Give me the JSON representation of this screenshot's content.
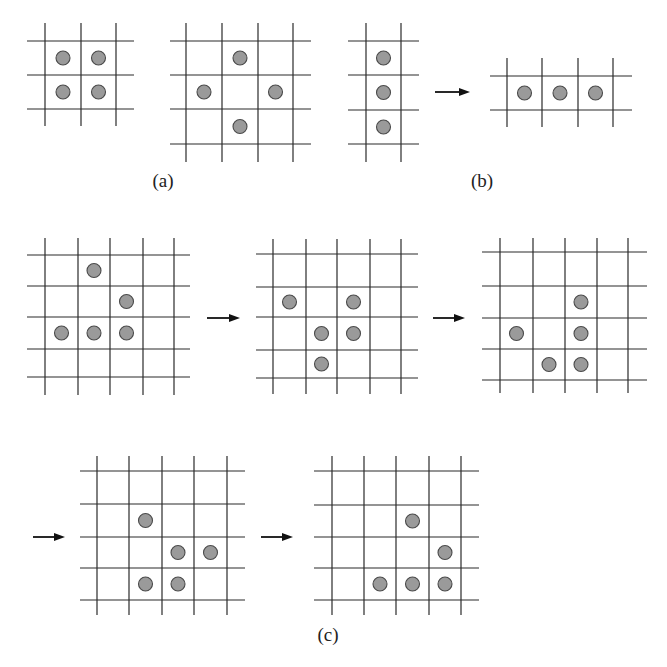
{
  "figure": {
    "labels": [
      {
        "id": "a",
        "text": "(a)",
        "x": 163,
        "y": 170
      },
      {
        "id": "b",
        "text": "(b)",
        "x": 482,
        "y": 170
      },
      {
        "id": "c",
        "text": "(c)",
        "x": 328,
        "y": 624
      }
    ],
    "colors": {
      "grid": "#2a2a2a",
      "cell_fill": "#9a9a9a",
      "cell_stroke": "#4a4a4a",
      "arrow": "#111111"
    },
    "panels": [
      {
        "name": "block-still-life",
        "group": "a",
        "vlines": [
          45,
          81,
          116
        ],
        "hlines": [
          41,
          75,
          109
        ],
        "xext": [
          27,
          134
        ],
        "yext": [
          23,
          126
        ],
        "cells": [
          [
            0,
            0
          ],
          [
            0,
            1
          ],
          [
            1,
            0
          ],
          [
            1,
            1
          ]
        ]
      },
      {
        "name": "tub-still-life",
        "group": "a",
        "vlines": [
          186,
          222,
          258,
          293
        ],
        "hlines": [
          41,
          75,
          109,
          144
        ],
        "xext": [
          170,
          311
        ],
        "yext": [
          23,
          162
        ],
        "cells": [
          [
            0,
            1
          ],
          [
            1,
            0
          ],
          [
            1,
            2
          ],
          [
            2,
            1
          ]
        ]
      },
      {
        "name": "blinker-vertical",
        "group": "b",
        "vlines": [
          366,
          401
        ],
        "hlines": [
          41,
          75,
          110,
          144
        ],
        "xext": [
          348,
          419
        ],
        "yext": [
          23,
          162
        ],
        "cells": [
          [
            0,
            0
          ],
          [
            1,
            0
          ],
          [
            2,
            0
          ]
        ]
      },
      {
        "name": "blinker-horizontal",
        "group": "b",
        "vlines": [
          507,
          542,
          578,
          613
        ],
        "hlines": [
          76,
          110
        ],
        "xext": [
          490,
          632
        ],
        "yext": [
          58,
          127
        ],
        "cells": [
          [
            0,
            0
          ],
          [
            0,
            1
          ],
          [
            0,
            2
          ]
        ]
      },
      {
        "name": "glider-gen-0",
        "group": "c",
        "vlines": [
          45,
          78,
          110,
          143,
          174
        ],
        "hlines": [
          255,
          286,
          317,
          349,
          377
        ],
        "xext": [
          27,
          190
        ],
        "yext": [
          238,
          395
        ],
        "cells": [
          [
            0,
            1
          ],
          [
            1,
            2
          ],
          [
            2,
            0
          ],
          [
            2,
            1
          ],
          [
            2,
            2
          ]
        ]
      },
      {
        "name": "glider-gen-1",
        "group": "c",
        "vlines": [
          273,
          306,
          337,
          370,
          401
        ],
        "hlines": [
          254,
          287,
          317,
          350,
          378
        ],
        "xext": [
          256,
          418
        ],
        "yext": [
          239,
          394
        ],
        "cells": [
          [
            1,
            0
          ],
          [
            1,
            2
          ],
          [
            2,
            1
          ],
          [
            2,
            2
          ],
          [
            3,
            1
          ]
        ]
      },
      {
        "name": "glider-gen-2",
        "group": "c",
        "vlines": [
          500,
          533,
          565,
          597,
          628
        ],
        "hlines": [
          252,
          286,
          318,
          349,
          380
        ],
        "xext": [
          482,
          647
        ],
        "yext": [
          238,
          393
        ],
        "cells": [
          [
            1,
            2
          ],
          [
            2,
            0
          ],
          [
            2,
            2
          ],
          [
            3,
            1
          ],
          [
            3,
            2
          ]
        ]
      },
      {
        "name": "glider-gen-3",
        "group": "c",
        "vlines": [
          97,
          129,
          162,
          194,
          227
        ],
        "hlines": [
          471,
          504,
          537,
          568,
          600
        ],
        "xext": [
          80,
          245
        ],
        "yext": [
          456,
          615
        ],
        "cells": [
          [
            1,
            1
          ],
          [
            2,
            2
          ],
          [
            2,
            3
          ],
          [
            3,
            1
          ],
          [
            3,
            2
          ]
        ]
      },
      {
        "name": "glider-gen-4",
        "group": "c",
        "vlines": [
          332,
          364,
          396,
          429,
          461
        ],
        "hlines": [
          471,
          505,
          537,
          568,
          600
        ],
        "xext": [
          314,
          479
        ],
        "yext": [
          456,
          615
        ],
        "cells": [
          [
            1,
            2
          ],
          [
            2,
            3
          ],
          [
            3,
            1
          ],
          [
            3,
            2
          ],
          [
            3,
            3
          ]
        ]
      }
    ],
    "arrows": [
      {
        "name": "blinker-transition-arrow",
        "x1": 435,
        "x2": 470,
        "y": 92
      },
      {
        "name": "glider-step-1-arrow",
        "x1": 207,
        "x2": 240,
        "y": 318
      },
      {
        "name": "glider-step-2-arrow",
        "x1": 433,
        "x2": 465,
        "y": 318
      },
      {
        "name": "glider-step-3-arrow",
        "x1": 33,
        "x2": 65,
        "y": 537
      },
      {
        "name": "glider-step-4-arrow",
        "x1": 261,
        "x2": 293,
        "y": 537
      }
    ]
  }
}
